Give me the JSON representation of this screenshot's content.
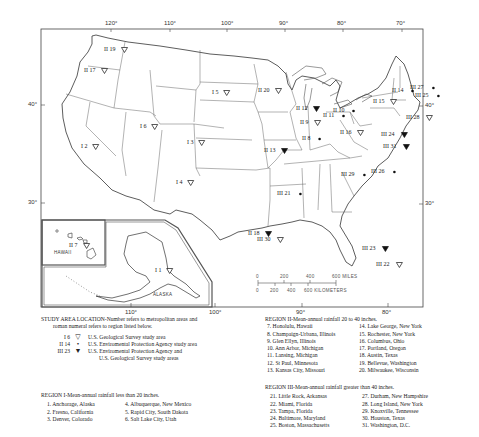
{
  "map": {
    "top_ticks": [
      {
        "label": "120°",
        "x": 111
      },
      {
        "label": "110°",
        "x": 170
      },
      {
        "label": "100°",
        "x": 227
      },
      {
        "label": "90°",
        "x": 285
      },
      {
        "label": "80°",
        "x": 343
      },
      {
        "label": "70°",
        "x": 402
      }
    ],
    "bottom_ticks": [
      {
        "label": "110°",
        "x": 131
      },
      {
        "label": "100°",
        "x": 215
      },
      {
        "label": "90°",
        "x": 302
      },
      {
        "label": "80°",
        "x": 388
      }
    ],
    "left_ticks": [
      {
        "label": "40°",
        "y": 105
      },
      {
        "label": "30°",
        "y": 203
      }
    ],
    "right_ticks": [
      {
        "label": "40°",
        "y": 106
      },
      {
        "label": "30°",
        "y": 204
      }
    ],
    "insets": {
      "hawaii_label": "HAWAII",
      "alaska_label": "ALASKA"
    },
    "scale_bar": {
      "miles_labels": [
        "0",
        "200",
        "400",
        "600 MILES"
      ],
      "km_labels": [
        "0",
        "200",
        "400",
        "600 KILOMETERS"
      ]
    },
    "sites": [
      {
        "label": "II 19",
        "x": 104,
        "y": 47,
        "symbol": "usgs"
      },
      {
        "label": "II 17",
        "x": 84,
        "y": 68,
        "symbol": "usgs"
      },
      {
        "label": "I 5",
        "x": 212,
        "y": 90,
        "symbol": "usgs"
      },
      {
        "label": "II 20",
        "x": 258,
        "y": 88,
        "symbol": "usgs"
      },
      {
        "label": "I 6",
        "x": 140,
        "y": 124,
        "symbol": "usgs"
      },
      {
        "label": "I 3",
        "x": 187,
        "y": 140,
        "symbol": "usgs"
      },
      {
        "label": "I 2",
        "x": 81,
        "y": 144,
        "symbol": "usgs"
      },
      {
        "label": "I 4",
        "x": 176,
        "y": 180,
        "symbol": "usgs"
      },
      {
        "label": "II 12",
        "x": 296,
        "y": 106,
        "symbol": "both"
      },
      {
        "label": "II 9",
        "x": 300,
        "y": 120,
        "symbol": "usgs"
      },
      {
        "label": "II 8",
        "x": 302,
        "y": 136,
        "symbol": "epa"
      },
      {
        "label": "II 13",
        "x": 264,
        "y": 148,
        "symbol": "both"
      },
      {
        "label": "II 10",
        "x": 333,
        "y": 108,
        "symbol": "epa"
      },
      {
        "label": "II 11",
        "x": 323,
        "y": 113,
        "symbol": "epa"
      },
      {
        "label": "II 16",
        "x": 340,
        "y": 130,
        "symbol": "usgs"
      },
      {
        "label": "II 14",
        "x": 392,
        "y": 88,
        "symbol": "epa"
      },
      {
        "label": "II 15",
        "x": 373,
        "y": 99,
        "symbol": "usgs"
      },
      {
        "label": "III 27",
        "x": 410,
        "y": 85,
        "symbol": "epa"
      },
      {
        "label": "III 25",
        "x": 415,
        "y": 93,
        "symbol": "epa"
      },
      {
        "label": "III 28",
        "x": 406,
        "y": 115,
        "symbol": "usgs"
      },
      {
        "label": "III 24",
        "x": 381,
        "y": 132,
        "symbol": "both"
      },
      {
        "label": "III 31",
        "x": 383,
        "y": 144,
        "symbol": "both"
      },
      {
        "label": "III 29",
        "x": 341,
        "y": 172,
        "symbol": "epa"
      },
      {
        "label": "III 26",
        "x": 371,
        "y": 169,
        "symbol": "epa"
      },
      {
        "label": "III 21",
        "x": 277,
        "y": 191,
        "symbol": "epa"
      },
      {
        "label": "II 18",
        "x": 248,
        "y": 231,
        "symbol": "both"
      },
      {
        "label": "III 30",
        "x": 257,
        "y": 237,
        "symbol": "usgs"
      },
      {
        "label": "III 23",
        "x": 362,
        "y": 246,
        "symbol": "both"
      },
      {
        "label": "III 22",
        "x": 376,
        "y": 262,
        "symbol": "usgs"
      },
      {
        "label": "II 7",
        "x": 69,
        "y": 243,
        "symbol": "usgs"
      },
      {
        "label": "I 1",
        "x": 155,
        "y": 268,
        "symbol": "usgs"
      }
    ]
  },
  "legend": {
    "title_line1": "STUDY AREA LOCATION-Number refers to metropolitan areas and",
    "title_line2": "roman numeral refers to region listed below.",
    "symbols": [
      {
        "code": "I 6",
        "glyph": "▽",
        "label": "U.S. Geological Survey study area"
      },
      {
        "code": "II 14",
        "glyph": "•",
        "label": "U.S. Enviromental Protection Agency study area"
      },
      {
        "code": "III 23",
        "glyph": "▼",
        "label": "U.S. Enviromental Protection Agency and",
        "label2": "U.S. Geological Survey study areas"
      }
    ]
  },
  "regions": {
    "region1": {
      "title": "REGION I-Mean-annual rainfall less than 20 inches.",
      "col1": [
        "1. Anchorage, Alaska",
        "2. Fresno, California",
        "3. Denver, Colorado"
      ],
      "col2": [
        "4. Albuquerque, New Mexico",
        "5. Rapid City, South Dakota",
        "6. Salt Lake City, Utah"
      ]
    },
    "region2": {
      "title": "REGION II-Mean-annual rainfall 20 to 40 inches.",
      "col1": [
        "7. Honolulu, Hawaii",
        "8. Champaign-Urbana, Illinois",
        "9. Glen Ellyn, Illinois",
        "10. Ann Arbor, Michigan",
        "11. Lansing, Michigan",
        "12. St Paul, Minnesota",
        "13. Kansas City, Missouri"
      ],
      "col2": [
        "14. Lake George, New York",
        "15. Rochester, New York",
        "16. Columbus, Ohio",
        "17. Portland, Oregon",
        "18. Austin, Texas",
        "19. Bellevue, Washington",
        "20. Milwaukee, Wisconsin"
      ]
    },
    "region3": {
      "title": "REGION III-Mean-annual rainfall greater than 40 inches.",
      "col1": [
        "21. Little Rock, Arkansas",
        "22. Miami, Florida",
        "23. Tampa, Florida",
        "24. Baltimore, Maryland",
        "25. Boston, Massachusetts"
      ],
      "col2": [
        "27. Durham, New Hampshire",
        "28. Long Island, New York",
        "29. Knoxville, Tennessee",
        "30. Houston, Texas",
        "31. Washington, D.C."
      ]
    }
  }
}
